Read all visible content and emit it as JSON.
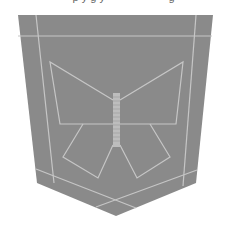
{
  "image": {
    "subject": "denim back pocket with butterfly stitching",
    "top_text_fragment": "· · ·  p y  g y  · · · · · · · · ·  g",
    "colors": {
      "background": "#ffffff",
      "pocket": "#8a8a8a",
      "stitch": "#c9c9c9"
    }
  }
}
